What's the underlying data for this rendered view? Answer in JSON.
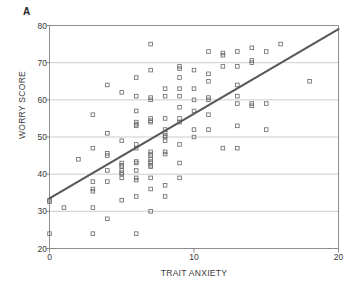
{
  "figure": {
    "panel_label": "A",
    "background_color": "#ffffff"
  },
  "chart_data": {
    "type": "scatter",
    "title": "",
    "subtitle": "",
    "xlabel": "TRAIT ANXIETY",
    "ylabel": "WORRY SCORE",
    "xlim": [
      0,
      20
    ],
    "ylim": [
      20,
      80
    ],
    "xticks": [
      0,
      10,
      20
    ],
    "yticks": [
      20,
      30,
      40,
      50,
      60,
      70,
      80
    ],
    "xtick_labels": [
      "0",
      "10",
      "20"
    ],
    "ytick_labels": [
      "20",
      "30",
      "40",
      "50",
      "60",
      "70",
      "80"
    ],
    "grid": "horizontal",
    "legend": "none",
    "marker": "open-square",
    "marker_color": "#6e6e6e",
    "line_color": "#585858",
    "axis_color": "#808080",
    "grid_color": "#b8b8b8",
    "trendline": {
      "label": "regression line",
      "x": [
        0,
        20
      ],
      "y": [
        33.5,
        79.0
      ],
      "slope": 2.275,
      "intercept": 33.5
    },
    "points": [
      [
        0,
        33
      ],
      [
        0,
        32.6
      ],
      [
        0,
        24
      ],
      [
        1,
        31
      ],
      [
        2,
        44
      ],
      [
        3,
        56
      ],
      [
        3,
        47
      ],
      [
        3,
        38
      ],
      [
        3,
        36
      ],
      [
        3,
        35.4
      ],
      [
        3,
        31
      ],
      [
        3,
        24
      ],
      [
        4,
        64
      ],
      [
        4,
        51
      ],
      [
        4,
        45.6
      ],
      [
        4,
        45
      ],
      [
        4,
        41
      ],
      [
        4,
        38
      ],
      [
        4,
        28
      ],
      [
        5,
        62
      ],
      [
        5,
        49
      ],
      [
        5,
        43
      ],
      [
        5,
        42.4
      ],
      [
        5,
        42
      ],
      [
        5,
        41
      ],
      [
        5,
        40.4
      ],
      [
        5,
        40
      ],
      [
        5,
        39
      ],
      [
        5,
        33
      ],
      [
        6,
        66
      ],
      [
        6,
        61
      ],
      [
        6,
        57
      ],
      [
        6,
        54
      ],
      [
        6,
        53.4
      ],
      [
        6,
        53
      ],
      [
        6,
        48
      ],
      [
        6,
        47
      ],
      [
        6,
        43.4
      ],
      [
        6,
        43
      ],
      [
        6,
        41
      ],
      [
        6,
        39
      ],
      [
        6,
        38.4
      ],
      [
        6,
        34
      ],
      [
        6,
        24
      ],
      [
        7,
        75
      ],
      [
        7,
        68
      ],
      [
        7,
        60.6
      ],
      [
        7,
        60
      ],
      [
        7,
        55
      ],
      [
        7,
        54.4
      ],
      [
        7,
        54
      ],
      [
        7,
        46
      ],
      [
        7,
        45.4
      ],
      [
        7,
        45
      ],
      [
        7,
        44
      ],
      [
        7,
        43.4
      ],
      [
        7,
        43
      ],
      [
        7,
        42.4
      ],
      [
        7,
        42
      ],
      [
        7,
        39
      ],
      [
        7,
        36
      ],
      [
        7,
        30
      ],
      [
        8,
        63
      ],
      [
        8,
        61
      ],
      [
        8,
        55
      ],
      [
        8,
        52
      ],
      [
        8,
        51
      ],
      [
        8,
        50.4
      ],
      [
        8,
        50
      ],
      [
        8,
        49
      ],
      [
        8,
        46
      ],
      [
        8,
        45.4
      ],
      [
        8,
        37
      ],
      [
        8,
        34
      ],
      [
        9,
        69
      ],
      [
        9,
        68.4
      ],
      [
        9,
        66
      ],
      [
        9,
        63
      ],
      [
        9,
        61
      ],
      [
        9,
        58
      ],
      [
        9,
        55
      ],
      [
        9,
        54
      ],
      [
        9,
        48
      ],
      [
        9,
        43
      ],
      [
        9,
        39
      ],
      [
        10,
        68
      ],
      [
        10,
        63
      ],
      [
        10,
        60
      ],
      [
        10,
        57
      ],
      [
        10,
        52
      ],
      [
        10,
        50
      ],
      [
        11,
        73
      ],
      [
        11,
        67
      ],
      [
        11,
        65
      ],
      [
        11,
        60.6
      ],
      [
        11,
        60
      ],
      [
        11,
        56
      ],
      [
        11,
        52
      ],
      [
        12,
        72.6
      ],
      [
        12,
        72
      ],
      [
        12,
        69
      ],
      [
        12,
        47
      ],
      [
        13,
        73
      ],
      [
        13,
        69
      ],
      [
        13,
        64
      ],
      [
        13,
        61
      ],
      [
        13,
        59
      ],
      [
        13,
        53
      ],
      [
        13,
        47
      ],
      [
        14,
        74
      ],
      [
        14,
        70.6
      ],
      [
        14,
        70
      ],
      [
        14,
        59
      ],
      [
        14,
        58.4
      ],
      [
        15,
        73
      ],
      [
        15,
        59
      ],
      [
        15,
        52
      ],
      [
        16,
        75
      ],
      [
        18,
        65
      ]
    ]
  }
}
